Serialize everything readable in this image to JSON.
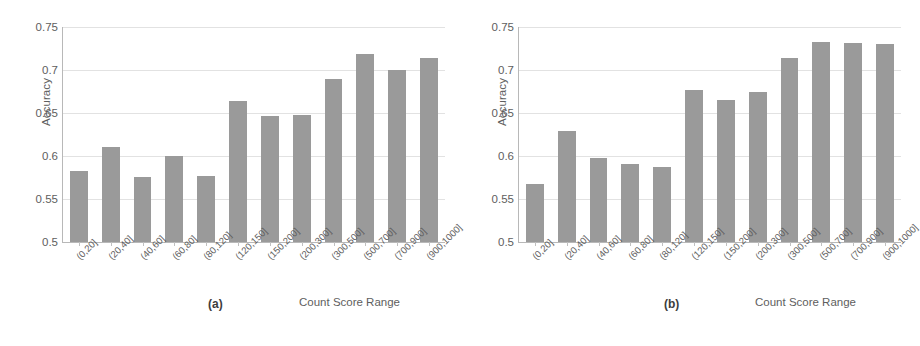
{
  "figure": {
    "background_color": "#ffffff",
    "bar_color": "#9a9a9a",
    "grid_color": "#e2e2e2",
    "axis_color": "#b8b8b8",
    "text_color": "#5e5e5e"
  },
  "panels": [
    {
      "caption": "(a)",
      "ylabel": "Accuracy",
      "xlabel": "Count Score Range"
    },
    {
      "caption": "(b)",
      "ylabel": "Accuracy",
      "xlabel": "Count Score Range"
    }
  ],
  "chart_data": [
    {
      "type": "bar",
      "title": "(a)",
      "xlabel": "Count Score Range",
      "ylabel": "Accuracy",
      "ylim": [
        0.5,
        0.75
      ],
      "yticks": [
        0.5,
        0.55,
        0.6,
        0.65,
        0.7,
        0.75
      ],
      "ytick_labels": [
        "0.5",
        "0.55",
        "0.6",
        "0.65",
        "0.7",
        "0.75"
      ],
      "grid": true,
      "legend": "none",
      "categories": [
        "(0,20]",
        "(20,40]",
        "(40,60]",
        "(60,80]",
        "(80,120]",
        "(120,150]",
        "(150,200]",
        "(200,300]",
        "(300,500]",
        "(500,700]",
        "(700,900]",
        "(900,1000]"
      ],
      "values": [
        0.582,
        0.61,
        0.576,
        0.6,
        0.577,
        0.664,
        0.647,
        0.648,
        0.69,
        0.719,
        0.7,
        0.714
      ]
    },
    {
      "type": "bar",
      "title": "(b)",
      "xlabel": "Count Score Range",
      "ylabel": "Accuracy",
      "ylim": [
        0.5,
        0.75
      ],
      "yticks": [
        0.5,
        0.55,
        0.6,
        0.65,
        0.7,
        0.75
      ],
      "ytick_labels": [
        "0.5",
        "0.55",
        "0.6",
        "0.65",
        "0.7",
        "0.75"
      ],
      "grid": true,
      "legend": "none",
      "categories": [
        "(0,20]",
        "(20,40]",
        "(40,60]",
        "(60,80]",
        "(80,120]",
        "(120,150]",
        "(150,200]",
        "(200,300]",
        "(300,500]",
        "(500,700]",
        "(700,900]",
        "(900,1000]"
      ],
      "values": [
        0.567,
        0.629,
        0.598,
        0.591,
        0.587,
        0.677,
        0.665,
        0.674,
        0.714,
        0.732,
        0.731,
        0.73
      ]
    }
  ]
}
